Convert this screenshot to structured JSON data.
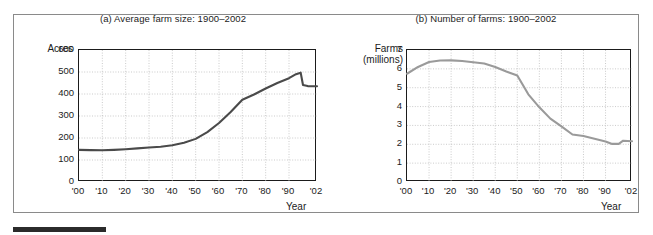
{
  "figure": {
    "background_color": "#ffffff",
    "frame_color": "#8a8a8a",
    "source_bar_color": "#2b2b2b"
  },
  "chart_data": [
    {
      "type": "line",
      "panel_id": "a",
      "title": "(a) Average farm size: 1900–2002",
      "ylabel": "Acres",
      "ylabel_line2": "",
      "xlabel": "Year",
      "line_color": "#4a4a4a",
      "grid": true,
      "grid_color": "#b5b5b5",
      "legend": "none",
      "xlim": [
        1900,
        2002
      ],
      "ylim": [
        0,
        600
      ],
      "ytick_values": [
        0,
        100,
        200,
        300,
        400,
        500,
        600
      ],
      "ytick_labels": [
        "0",
        "100",
        "200",
        "300",
        "400",
        "500",
        "600"
      ],
      "xtick_values": [
        1900,
        1910,
        1920,
        1930,
        1940,
        1950,
        1960,
        1970,
        1980,
        1990,
        2002
      ],
      "xtick_labels": [
        "'00",
        "'10",
        "'20",
        "'30",
        "'40",
        "'50",
        "'60",
        "'70",
        "'80",
        "'90",
        "'02"
      ],
      "x": [
        1900,
        1905,
        1910,
        1915,
        1920,
        1925,
        1930,
        1935,
        1940,
        1945,
        1950,
        1955,
        1960,
        1965,
        1970,
        1975,
        1980,
        1985,
        1990,
        1993,
        1995,
        1996,
        1998,
        2002
      ],
      "values": [
        146,
        145,
        144,
        146,
        149,
        153,
        157,
        160,
        167,
        178,
        196,
        227,
        268,
        318,
        374,
        398,
        425,
        450,
        472,
        490,
        497,
        441,
        436,
        435
      ]
    },
    {
      "type": "line",
      "panel_id": "b",
      "title": "(b) Number of farms: 1900–2002",
      "ylabel": "Farms",
      "ylabel_line2": "(millions)",
      "xlabel": "Year",
      "line_color": "#9a9a9a",
      "grid": true,
      "grid_color": "#b5b5b5",
      "legend": "none",
      "xlim": [
        1900,
        2002
      ],
      "ylim": [
        0,
        7
      ],
      "ytick_values": [
        0,
        1,
        2,
        3,
        4,
        5,
        6,
        7
      ],
      "ytick_labels": [
        "0",
        "1",
        "2",
        "3",
        "4",
        "5",
        "6",
        "7"
      ],
      "xtick_values": [
        1900,
        1910,
        1920,
        1930,
        1940,
        1950,
        1960,
        1970,
        1980,
        1990,
        2002
      ],
      "xtick_labels": [
        "'00",
        "'10",
        "'20",
        "'30",
        "'40",
        "'50",
        "'60",
        "'70",
        "'80",
        "'90",
        "'02"
      ],
      "x": [
        1900,
        1905,
        1910,
        1915,
        1920,
        1925,
        1930,
        1935,
        1940,
        1945,
        1950,
        1955,
        1960,
        1965,
        1970,
        1975,
        1980,
        1985,
        1990,
        1993,
        1996,
        1998,
        2002
      ],
      "values": [
        5.74,
        6.1,
        6.36,
        6.44,
        6.45,
        6.42,
        6.35,
        6.28,
        6.1,
        5.86,
        5.65,
        4.65,
        3.96,
        3.36,
        2.95,
        2.52,
        2.44,
        2.29,
        2.15,
        2.02,
        2.02,
        2.19,
        2.16
      ]
    }
  ]
}
